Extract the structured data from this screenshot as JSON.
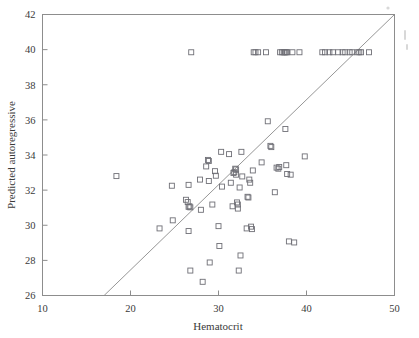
{
  "figure": {
    "name": "hematocrit-vs-predicted-autoregressive-scatter"
  },
  "chart_data": {
    "type": "scatter",
    "title": "",
    "subtitle": "",
    "xlabel": "Hematocrit",
    "ylabel": "Predicted autoregressive",
    "xlim": [
      10,
      50
    ],
    "ylim": [
      26,
      42
    ],
    "xticks": [
      10,
      20,
      30,
      40,
      50
    ],
    "yticks": [
      26,
      28,
      30,
      32,
      34,
      36,
      38,
      40,
      42
    ],
    "xtick_labels": [
      "10",
      "20",
      "30",
      "40",
      "50"
    ],
    "ytick_labels": [
      "26",
      "28",
      "30",
      "32",
      "34",
      "36",
      "38",
      "40",
      "42"
    ],
    "grid": false,
    "legend": null,
    "legend_position": "none",
    "marker": "open-square",
    "marker_color": "#6f6f76",
    "marker_size": 5,
    "frame_color": "#8d8d8d",
    "annotations": [
      {
        "name": "identity-reference-line",
        "type": "line",
        "label": "y = x",
        "x0": 17.0,
        "y0": 26.0,
        "x1": 50.0,
        "y1": 42.0,
        "color": "#8a8a8a"
      },
      {
        "name": "censored-value-band",
        "type": "note",
        "label": "Row of points pinned at 39.85",
        "y": 39.85
      }
    ],
    "series": [
      {
        "name": "observations",
        "marker": "open-square",
        "color": "#6f6f76",
        "points": [
          [
            18.4,
            32.8
          ],
          [
            23.3,
            29.82
          ],
          [
            24.7,
            32.25
          ],
          [
            24.8,
            30.28
          ],
          [
            26.3,
            31.45
          ],
          [
            26.5,
            31.32
          ],
          [
            26.6,
            32.3
          ],
          [
            26.6,
            31.05
          ],
          [
            26.7,
            31.08
          ],
          [
            26.8,
            31.02
          ],
          [
            26.9,
            39.85
          ],
          [
            26.6,
            29.67
          ],
          [
            26.8,
            27.42
          ],
          [
            27.9,
            32.6
          ],
          [
            28.0,
            30.88
          ],
          [
            28.2,
            26.78
          ],
          [
            28.6,
            33.35
          ],
          [
            28.8,
            33.72
          ],
          [
            28.9,
            33.66
          ],
          [
            28.9,
            32.52
          ],
          [
            29.0,
            27.88
          ],
          [
            29.3,
            31.18
          ],
          [
            29.6,
            33.08
          ],
          [
            29.7,
            32.82
          ],
          [
            30.0,
            29.95
          ],
          [
            30.1,
            28.82
          ],
          [
            30.3,
            34.18
          ],
          [
            30.4,
            32.2
          ],
          [
            31.2,
            34.05
          ],
          [
            31.4,
            32.42
          ],
          [
            31.6,
            31.08
          ],
          [
            31.7,
            32.98
          ],
          [
            31.8,
            33.02
          ],
          [
            31.9,
            33.22
          ],
          [
            32.0,
            33.18
          ],
          [
            32.0,
            32.88
          ],
          [
            32.1,
            31.3
          ],
          [
            32.2,
            31.18
          ],
          [
            32.2,
            30.95
          ],
          [
            32.3,
            27.42
          ],
          [
            32.4,
            32.15
          ],
          [
            32.5,
            28.28
          ],
          [
            32.6,
            34.18
          ],
          [
            32.7,
            32.78
          ],
          [
            33.2,
            29.82
          ],
          [
            33.3,
            31.62
          ],
          [
            33.4,
            31.58
          ],
          [
            33.5,
            32.6
          ],
          [
            33.6,
            32.42
          ],
          [
            33.7,
            29.92
          ],
          [
            33.8,
            29.78
          ],
          [
            33.9,
            33.12
          ],
          [
            34.0,
            39.85
          ],
          [
            34.2,
            39.85
          ],
          [
            34.5,
            39.85
          ],
          [
            34.9,
            33.58
          ],
          [
            35.4,
            39.85
          ],
          [
            35.6,
            35.92
          ],
          [
            35.9,
            34.52
          ],
          [
            36.0,
            34.45
          ],
          [
            36.4,
            31.88
          ],
          [
            36.6,
            33.28
          ],
          [
            36.8,
            33.22
          ],
          [
            36.9,
            33.32
          ],
          [
            37.0,
            39.85
          ],
          [
            37.2,
            39.85
          ],
          [
            37.4,
            39.85
          ],
          [
            37.5,
            39.85
          ],
          [
            37.6,
            39.85
          ],
          [
            37.7,
            39.85
          ],
          [
            37.8,
            39.85
          ],
          [
            37.6,
            35.48
          ],
          [
            37.7,
            33.42
          ],
          [
            37.8,
            32.92
          ],
          [
            38.0,
            29.08
          ],
          [
            38.2,
            32.88
          ],
          [
            38.4,
            39.85
          ],
          [
            38.6,
            29.02
          ],
          [
            39.2,
            39.85
          ],
          [
            39.8,
            33.92
          ],
          [
            41.8,
            39.85
          ],
          [
            42.1,
            39.85
          ],
          [
            42.6,
            39.85
          ],
          [
            43.0,
            39.85
          ],
          [
            43.6,
            39.85
          ],
          [
            44.1,
            39.85
          ],
          [
            44.4,
            39.85
          ],
          [
            44.9,
            39.85
          ],
          [
            45.2,
            39.85
          ],
          [
            45.8,
            39.85
          ],
          [
            46.0,
            39.85
          ],
          [
            46.2,
            39.85
          ],
          [
            47.1,
            39.85
          ]
        ]
      }
    ]
  }
}
